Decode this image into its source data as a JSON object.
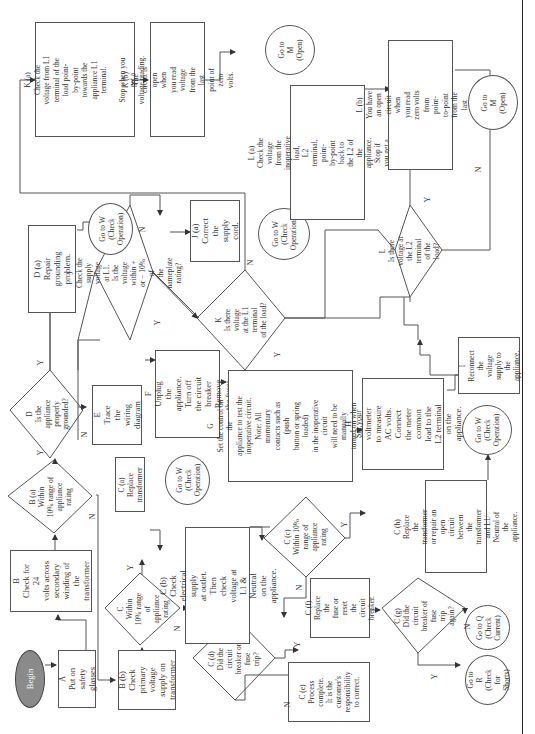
{
  "diagram": {
    "type": "troubleshooting-flowchart",
    "orientation": "rotated-90-ccw",
    "nodes": {
      "begin": {
        "label": "Begin"
      },
      "A": {
        "label": "A\nPut on safety\nglasses"
      },
      "B": {
        "label": "B\nCheck for 24\nvolts across\nsecondary\nwinding of\nthe\ntransformer"
      },
      "Ba": {
        "label": "B (a)\nWithin\n10% range of\nappliance\nrating"
      },
      "Bb": {
        "label": "B (b)\nCheck\nprimary\nvoltage\nsupply on\ntransformer"
      },
      "C": {
        "label": "C\nWithin\n10% range of\nappliance\nrating"
      },
      "Ca": {
        "label": "C (a)\nReplace\ntransformer"
      },
      "Cb": {
        "label": "C (b)\nCheck electrical supply\nat outlet. Then check\nvoltage at L1 & Neutral\non the appliance."
      },
      "Cc": {
        "label": "C (c)\nWithin 10%\nrange of\nappliance\nrating"
      },
      "Cd": {
        "label": "C (d)\nDid the circuit\nbreaker or fuse\ntrip?"
      },
      "Ce": {
        "label": "C (e)\nProcess\ncomplete.\nIt is the\ncustomer's\nresponsibility\nto correct."
      },
      "Cf": {
        "label": "C (f)\nReplace the\nfuse or reset\nthe circuit\nbreaker."
      },
      "Cg": {
        "label": "C (g)\nDid the circuit\nbreaker of fuse\ntrip\nagain?"
      },
      "Ch": {
        "label": "C (h)\nReplace the\ntransformer\nor repair an\nopen circuit\nbetween the\ntransformer\nand L1/\nNeutral of the\nappliance."
      },
      "D": {
        "label": "D\nIs the\nappliance properly\ngrounded?"
      },
      "Da": {
        "label": "D (a)\nRepair grounding\nproblem."
      },
      "E": {
        "label": "E\nTrace the\nwiring diagram"
      },
      "F": {
        "label": "F\nUnplug the\nappliance. Turn off\nthe circuit breaker\nRemove the fuses."
      },
      "G": {
        "label": "G\nSet the control on the\nappliance to test the\ninoperative circuit.\nNote: All momentary\ncontacts such as (push\nbutton or spring loaded)\nin the inoperative circuit\nwill need to be manually\nturned on when voltage\nchecks are made."
      },
      "H": {
        "label": "H\nSet your voltmeter\nto measure AC volts.\nConnect the meter\ncommon lead to the\nL2 terminal on the\nappliance."
      },
      "I": {
        "label": "I\nReconnect\nthe voltage\nsupply to the\nappliance."
      },
      "J": {
        "label": "J\nCheck the\nsupply voltage\nat L1.\nIs the voltage\nwithin + or − 10% of\nthe nameplate\nrating?"
      },
      "Ja": {
        "label": "J (a)\nCorrect the\nsupply cord."
      },
      "K": {
        "label": "K\nIs there voltage\nat the L1 terminal\nof the load?"
      },
      "Ka": {
        "label": "K (a)\nCheck the voltage from L1\nterminal of the load point-\nby-point towards the\nappliance L1 terminal.\n\nStop when you get a\nvoltage reading."
      },
      "Kb": {
        "label": "K (b)\nThe circuit is open when\nyou read voltage from the\nlast point of zero volts."
      },
      "L": {
        "label": "L\nIs there\nvoltage at the L2\nterminal\nof the load?"
      },
      "La": {
        "label": "L (a)\nCheck the voltage\nfrom the\ninoperative load,\nL2 terminal, point-\nby-point back to\nthe L2 of the\nappliance. Stop if\nyou get a zero\nreading."
      },
      "Lb": {
        "label": "L (b)\nYou have an open circuit when\nyou read zero volts from point-\nto-point from the last voltage\nreading."
      },
      "goW1": {
        "label": "Go to W\n(Check\nOperation)"
      },
      "goW2": {
        "label": "Go to W\n(Check\nOperation)"
      },
      "goW3": {
        "label": "Go to W\n(Check\nOperation)"
      },
      "goW4": {
        "label": "Go to W\n(Check\nOperation)"
      },
      "goM1": {
        "label": "Go to M\n(Open)"
      },
      "goM2": {
        "label": "Go to M\n(Open)"
      },
      "goQ": {
        "label": "Go to Q\n(Check\nCurrent)"
      },
      "goR": {
        "label": "Go to R\n(Check for\nShorts)"
      }
    },
    "edge_labels": {
      "yes": "Y",
      "no": "N"
    },
    "colors": {
      "line": "#555555",
      "begin_fill": "#8a8a8a",
      "text": "#333333"
    }
  }
}
